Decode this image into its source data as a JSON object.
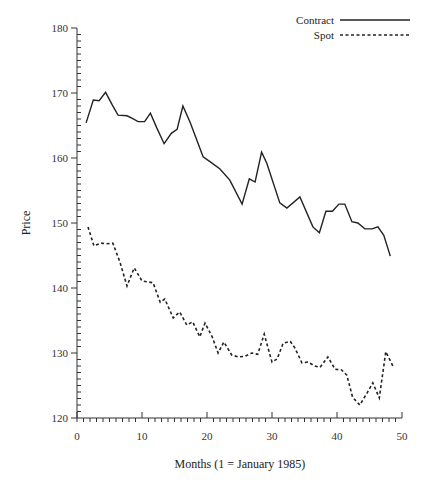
{
  "chart_data": {
    "type": "line",
    "title": "",
    "xlabel": "Months (1 = January 1985)",
    "ylabel": "Price",
    "xlim": [
      0,
      50
    ],
    "ylim": [
      120,
      180
    ],
    "xticks": [
      0,
      10,
      20,
      30,
      40,
      50
    ],
    "yticks": [
      120,
      130,
      140,
      150,
      160,
      170,
      180
    ],
    "x_minor_step": 1,
    "y_minor_step": 1,
    "grid": false,
    "legend_position": "upper right",
    "series": [
      {
        "name": "Contract",
        "style": "solid",
        "color": "#222222",
        "points": [
          [
            1.4,
            165.4
          ],
          [
            2.5,
            168.9
          ],
          [
            3.4,
            168.8
          ],
          [
            4.4,
            170.1
          ],
          [
            5.4,
            168.2
          ],
          [
            6.3,
            166.6
          ],
          [
            7.7,
            166.5
          ],
          [
            8.5,
            166.1
          ],
          [
            9.4,
            165.6
          ],
          [
            10.4,
            165.6
          ],
          [
            11.3,
            166.9
          ],
          [
            12.3,
            164.6
          ],
          [
            13.4,
            162.2
          ],
          [
            14.5,
            163.8
          ],
          [
            15.4,
            164.4
          ],
          [
            16.3,
            168.0
          ],
          [
            17.4,
            165.5
          ],
          [
            19.4,
            160.2
          ],
          [
            20.5,
            159.4
          ],
          [
            22.0,
            158.3
          ],
          [
            23.5,
            156.6
          ],
          [
            25.4,
            152.9
          ],
          [
            26.5,
            156.8
          ],
          [
            27.4,
            156.3
          ],
          [
            28.4,
            160.9
          ],
          [
            29.2,
            159.2
          ],
          [
            31.2,
            153.1
          ],
          [
            32.3,
            152.3
          ],
          [
            34.3,
            154.0
          ],
          [
            36.3,
            149.4
          ],
          [
            37.3,
            148.5
          ],
          [
            38.3,
            151.8
          ],
          [
            39.3,
            151.8
          ],
          [
            40.3,
            152.9
          ],
          [
            41.2,
            152.9
          ],
          [
            42.3,
            150.2
          ],
          [
            43.2,
            150.0
          ],
          [
            44.3,
            149.1
          ],
          [
            45.4,
            149.1
          ],
          [
            46.3,
            149.4
          ],
          [
            47.2,
            148.1
          ],
          [
            48.2,
            144.9
          ]
        ]
      },
      {
        "name": "Spot",
        "style": "dashed",
        "color": "#222222",
        "points": [
          [
            1.7,
            149.4
          ],
          [
            2.6,
            146.5
          ],
          [
            3.7,
            146.9
          ],
          [
            4.5,
            146.8
          ],
          [
            5.5,
            146.9
          ],
          [
            6.6,
            144.0
          ],
          [
            7.7,
            140.3
          ],
          [
            8.8,
            143.1
          ],
          [
            10.0,
            141.1
          ],
          [
            11.7,
            140.8
          ],
          [
            12.8,
            137.8
          ],
          [
            13.5,
            138.3
          ],
          [
            14.8,
            135.4
          ],
          [
            15.8,
            136.3
          ],
          [
            16.9,
            134.3
          ],
          [
            17.8,
            134.8
          ],
          [
            18.9,
            132.5
          ],
          [
            19.7,
            134.6
          ],
          [
            20.8,
            132.5
          ],
          [
            21.7,
            130.0
          ],
          [
            22.6,
            131.7
          ],
          [
            23.8,
            129.7
          ],
          [
            24.8,
            129.4
          ],
          [
            25.8,
            129.5
          ],
          [
            26.9,
            130.0
          ],
          [
            27.8,
            129.8
          ],
          [
            28.8,
            132.9
          ],
          [
            30.0,
            128.6
          ],
          [
            30.8,
            129.1
          ],
          [
            31.7,
            131.5
          ],
          [
            32.8,
            131.8
          ],
          [
            33.5,
            130.8
          ],
          [
            34.6,
            128.5
          ],
          [
            35.5,
            128.6
          ],
          [
            36.6,
            128.0
          ],
          [
            37.4,
            127.8
          ],
          [
            38.6,
            129.4
          ],
          [
            39.7,
            127.5
          ],
          [
            40.7,
            127.4
          ],
          [
            41.5,
            126.6
          ],
          [
            42.4,
            123.2
          ],
          [
            43.5,
            122.0
          ],
          [
            44.6,
            123.8
          ],
          [
            45.5,
            125.4
          ],
          [
            46.5,
            123.1
          ],
          [
            47.5,
            130.2
          ],
          [
            48.6,
            128.0
          ]
        ]
      }
    ]
  },
  "legend": {
    "items": [
      {
        "label": "Contract"
      },
      {
        "label": "Spot"
      }
    ]
  },
  "axes": {
    "xlabel": "Months (1 = January 1985)",
    "ylabel": "Price",
    "xtick_labels": [
      "0",
      "10",
      "20",
      "30",
      "40",
      "50"
    ],
    "ytick_labels": [
      "120",
      "130",
      "140",
      "150",
      "160",
      "170",
      "180"
    ]
  }
}
